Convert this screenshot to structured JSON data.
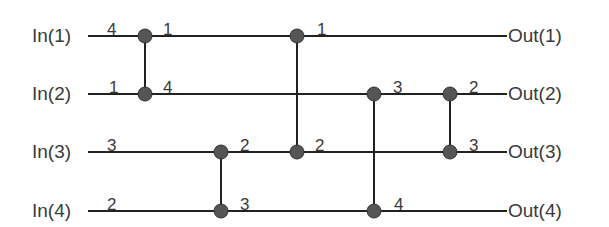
{
  "diagram": {
    "type": "sorting-network",
    "inputs": [
      {
        "label": "In(1)",
        "value": "4",
        "y": 36
      },
      {
        "label": "In(2)",
        "value": "1",
        "y": 94
      },
      {
        "label": "In(3)",
        "value": "3",
        "y": 152
      },
      {
        "label": "In(4)",
        "value": "2",
        "y": 211
      }
    ],
    "outputs": [
      {
        "label": "Out(1)"
      },
      {
        "label": "Out(2)"
      },
      {
        "label": "Out(3)"
      },
      {
        "label": "Out(4)"
      }
    ],
    "comparators": [
      {
        "x": 145,
        "wires": [
          1,
          2
        ],
        "out_values": {
          "top": "1",
          "bottom": "4"
        }
      },
      {
        "x": 221,
        "wires": [
          3,
          4
        ],
        "out_values": {
          "top": "2",
          "bottom": "3"
        }
      },
      {
        "x": 297,
        "wires": [
          1,
          3
        ],
        "out_values": {
          "top": "1",
          "bottom": "2"
        }
      },
      {
        "x": 374,
        "wires": [
          2,
          4
        ],
        "out_values": {
          "top": "3",
          "bottom": "4"
        }
      },
      {
        "x": 450,
        "wires": [
          2,
          3
        ],
        "out_values": {
          "top": "2",
          "bottom": "3"
        }
      }
    ],
    "colors": {
      "line": "#222222",
      "node": "#555555",
      "text": "#3a3a3a"
    }
  }
}
